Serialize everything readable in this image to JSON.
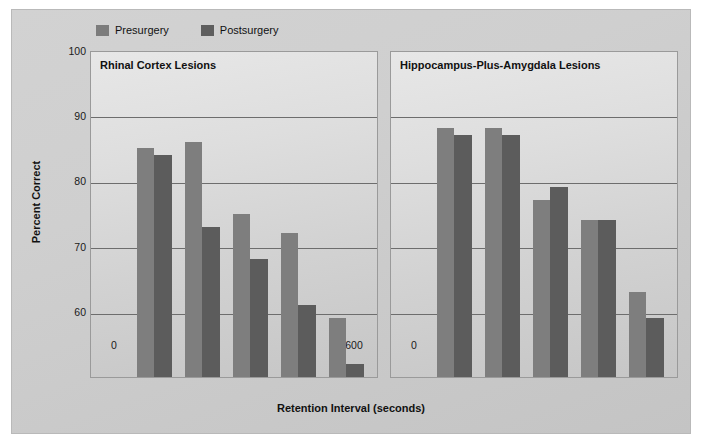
{
  "figure": {
    "background_color": "#cdcdcd",
    "panel_background_color": "#dcdcdc"
  },
  "legend": {
    "position": "top-left",
    "items": [
      {
        "label": "Presurgery",
        "color": "#7e7e7e",
        "key": "presurgery"
      },
      {
        "label": "Postsurgery",
        "color": "#5c5c5c",
        "key": "postsurgery"
      }
    ]
  },
  "axes": {
    "ylabel": "Percent Correct",
    "xlabel": "Retention Interval (seconds)",
    "yticks": [
      "100",
      "90",
      "80",
      "70",
      "60"
    ],
    "ylim": [
      50,
      100
    ],
    "xticks": [
      "0",
      "4",
      "15",
      "60",
      "120",
      "600"
    ]
  },
  "chart_data": {
    "type": "bar",
    "title": "",
    "xlabel": "Retention Interval (seconds)",
    "ylabel": "Percent Correct",
    "ylim": [
      50,
      100
    ],
    "yticks": [
      60,
      70,
      80,
      90,
      100
    ],
    "grid": "horizontal",
    "legend_position": "top-left",
    "categories": [
      "0",
      "4",
      "15",
      "60",
      "120",
      "600"
    ],
    "note": "Category '0' has no bars; bars are drawn for 4, 15, 60, 120, 600 seconds.",
    "panels": [
      {
        "title": "Rhinal Cortex Lesions",
        "categories": [
          "4",
          "15",
          "60",
          "120",
          "600"
        ],
        "series": [
          {
            "name": "Presurgery",
            "values": [
              85,
              86,
              75,
              72,
              59
            ]
          },
          {
            "name": "Postsurgery",
            "values": [
              84,
              73,
              68,
              61,
              52
            ]
          }
        ]
      },
      {
        "title": "Hippocampus-Plus-Amygdala Lesions",
        "categories": [
          "4",
          "15",
          "60",
          "120",
          "600"
        ],
        "series": [
          {
            "name": "Presurgery",
            "values": [
              88,
              88,
              77,
              74,
              63
            ]
          },
          {
            "name": "Postsurgery",
            "values": [
              87,
              87,
              79,
              74,
              59
            ]
          }
        ]
      }
    ]
  }
}
